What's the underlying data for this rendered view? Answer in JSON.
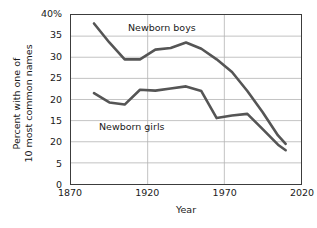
{
  "chart_data": {
    "type": "line",
    "title": "",
    "subtitle": "",
    "xlabel": "Year",
    "ylabel": "Percent with one of 10 most common names",
    "ylabel_lines": [
      "Percent with one of",
      "10 most common names"
    ],
    "xlim": [
      1870,
      2020
    ],
    "ylim": [
      0,
      40
    ],
    "grid": true,
    "grid_axis": "both",
    "legend": "inline-labels",
    "legend_position": "inside-plot",
    "xticks": [
      1870,
      1920,
      1970,
      2020
    ],
    "xtick_labels": [
      "1870",
      "1920",
      "1970",
      "2020"
    ],
    "yticks": [
      0,
      5,
      10,
      15,
      20,
      25,
      30,
      35,
      40
    ],
    "ytick_labels": [
      "0",
      "5",
      "20",
      "15",
      "20",
      "25",
      "30",
      "35",
      "40%"
    ],
    "series": [
      {
        "name": "Newborn boys",
        "color": "#555555",
        "label_text": "Newborn boys",
        "x": [
          1885,
          1895,
          1905,
          1915,
          1925,
          1935,
          1945,
          1955,
          1965,
          1975,
          1985,
          1995,
          2005,
          2010
        ],
        "values": [
          38.0,
          33.5,
          29.5,
          29.5,
          31.8,
          32.2,
          33.5,
          32.0,
          29.5,
          26.5,
          22.0,
          17.0,
          11.5,
          9.5
        ]
      },
      {
        "name": "Newborn girls",
        "color": "#555555",
        "label_text": "Newborn girls",
        "x": [
          1885,
          1895,
          1905,
          1915,
          1925,
          1935,
          1945,
          1955,
          1965,
          1975,
          1985,
          1995,
          2005,
          2010
        ],
        "values": [
          21.5,
          19.3,
          18.8,
          22.3,
          22.1,
          22.6,
          23.1,
          22.0,
          15.6,
          16.2,
          16.6,
          13.0,
          9.3,
          8.0
        ]
      }
    ],
    "colors": {
      "series_line": "#555555",
      "axis": "#3c3c3c",
      "grid": "#b4b4b4",
      "text": "#1a1a1a",
      "background": "#ffffff"
    }
  }
}
